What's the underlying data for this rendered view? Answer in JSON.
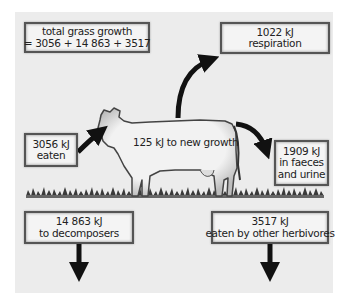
{
  "diagram": {
    "title_box": {
      "line1": "total grass growth",
      "line2": "= 3056 + 14 863 + 3517"
    },
    "respiration_box": {
      "value": "1022 kJ",
      "label": "respiration"
    },
    "eaten_box": {
      "value": "3056 kJ",
      "label": "eaten"
    },
    "faeces_box": {
      "value": "1909 kJ",
      "label1": "in faeces",
      "label2": "and urine"
    },
    "cow": {
      "label": "125 kJ to new growth"
    },
    "decomposers_box": {
      "value": "14 863 kJ",
      "label": "to decomposers"
    },
    "herbivores_box": {
      "value": "3517 kJ",
      "label": "eaten by other herbivores"
    },
    "colors": {
      "panel": "#ececec",
      "box_fill": "#f4f4f4",
      "box_border": "#555555",
      "arrow": "#111111"
    }
  }
}
